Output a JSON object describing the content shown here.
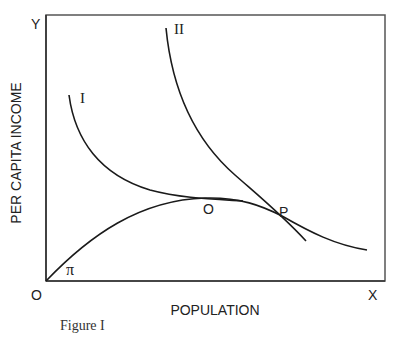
{
  "figure": {
    "caption": "Figure I",
    "axes": {
      "y_axis_end_label": "Y",
      "x_axis_end_label": "X",
      "origin_label": "O",
      "y_label": "PER CAPITA INCOME",
      "x_label": "POPULATION"
    },
    "curves": [
      {
        "id": "pi",
        "label": "π",
        "description": "Concave curve rising from origin, peaking at O, then declining through P"
      },
      {
        "id": "I",
        "label": "I",
        "description": "Convex declining curve tangent to π at O"
      },
      {
        "id": "II",
        "label": "II",
        "description": "Steeper convex declining curve tangent to π at P"
      }
    ],
    "points": [
      {
        "id": "O",
        "label": "O",
        "description": "Tangency of curve I with curve π (maximum of π)"
      },
      {
        "id": "P",
        "label": "P",
        "description": "Tangency of curve II with curve π"
      }
    ],
    "colors": {
      "line": "#1a1a1a",
      "frame": "#555555",
      "background": "#ffffff"
    }
  }
}
